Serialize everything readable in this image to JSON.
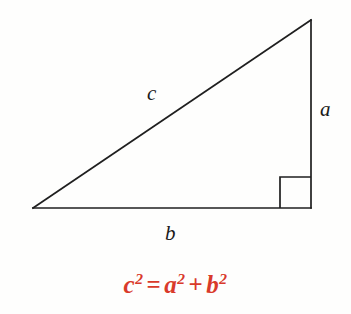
{
  "figure": {
    "background_color": "#fefefd",
    "line_color": "#1f1f1f",
    "line_width": 1.6
  },
  "triangle": {
    "vertices": {
      "left": {
        "x": 33,
        "y": 208
      },
      "top_right": {
        "x": 311,
        "y": 20
      },
      "bottom_right": {
        "x": 311,
        "y": 208
      }
    },
    "right_angle_marker": {
      "x": 280,
      "y": 177,
      "size": 31,
      "at_vertex": "bottom_right"
    }
  },
  "labels": {
    "hypotenuse": "c",
    "vertical_leg": "a",
    "horizontal_leg": "b"
  },
  "formula": {
    "color": "#d93a2b",
    "base_c": "c",
    "exp_c": "2",
    "equals": "=",
    "base_a": "a",
    "exp_a": "2",
    "plus": "+",
    "base_b": "b",
    "exp_b": "2",
    "plain_text": "c² = a² + b²"
  }
}
